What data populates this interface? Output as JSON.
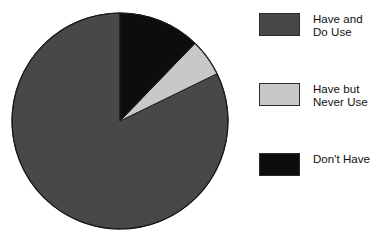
{
  "chart_data": {
    "type": "pie",
    "title": "",
    "subtitle": "",
    "xlabel": "",
    "ylabel": "",
    "grid": false,
    "legend_position": "right",
    "start_angle_deg": 0,
    "direction": "clockwise",
    "categories": [
      "Have and Do Use",
      "Have but Never Use",
      "Don't Have"
    ],
    "values": [
      82.5,
      5.5,
      12.0
    ],
    "units": "percent",
    "colors": [
      "#484848",
      "#c8c8c8",
      "#0d0d0d"
    ],
    "slices": [
      {
        "label": "Have and Do Use",
        "label_lines": [
          "Have and",
          "Do Use"
        ],
        "value": 82.5,
        "color": "#484848",
        "start_deg": 64,
        "end_deg": 360
      },
      {
        "label": "Have but Never Use",
        "label_lines": [
          "Have but",
          "Never Use"
        ],
        "value": 5.5,
        "color": "#c8c8c8",
        "start_deg": 44,
        "end_deg": 64
      },
      {
        "label": "Don't Have",
        "label_lines": [
          "Don't Have"
        ],
        "value": 12.0,
        "color": "#0d0d0d",
        "start_deg": 0,
        "end_deg": 44
      }
    ]
  },
  "pie": {
    "center_x": 120,
    "center_y": 121,
    "radius": 108,
    "outline_color": "#1a1a1a"
  },
  "legend": {
    "items": [
      {
        "label": "Have and\nDo Use",
        "color": "#484848",
        "swatch_name": "legend-swatch-have-and-do-use"
      },
      {
        "label": "Have but\nNever Use",
        "color": "#c8c8c8",
        "swatch_name": "legend-swatch-have-but-never-use"
      },
      {
        "label": "Don't Have",
        "color": "#0d0d0d",
        "swatch_name": "legend-swatch-dont-have"
      }
    ]
  }
}
